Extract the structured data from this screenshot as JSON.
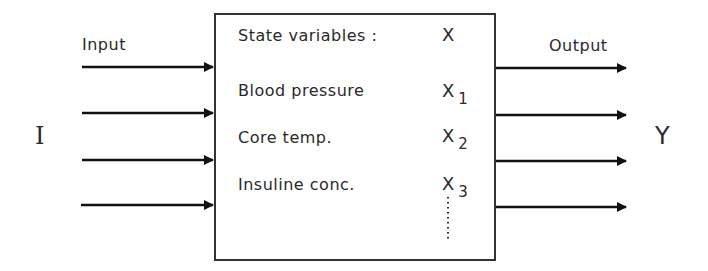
{
  "diagram": {
    "type": "block-diagram",
    "input_label": "Input",
    "output_label": "Output",
    "input_symbol": "I",
    "output_symbol": "Y",
    "input_arrow_count": 4,
    "output_arrow_count": 4,
    "box": {
      "title": "State variables :",
      "title_symbol": "X",
      "variables": [
        {
          "name": "Blood pressure",
          "symbol": "X",
          "subscript": "1"
        },
        {
          "name": "Core temp.",
          "symbol": "X",
          "subscript": "2"
        },
        {
          "name": "Insuline conc.",
          "symbol": "X",
          "subscript": "3"
        }
      ],
      "continuation": "⋮"
    }
  }
}
